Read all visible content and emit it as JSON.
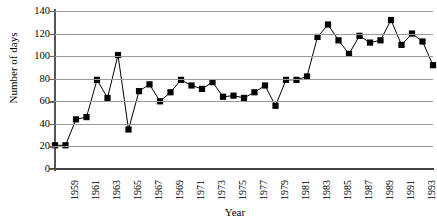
{
  "chart_data": {
    "type": "line",
    "title": "",
    "xlabel": "Year",
    "ylabel": "Number of days",
    "ylim": [
      0,
      140
    ],
    "ytick_values": [
      0,
      20,
      40,
      60,
      80,
      100,
      120,
      140
    ],
    "ytick_labels": [
      "0",
      "20",
      "40",
      "60",
      "80",
      "100",
      "120",
      "140"
    ],
    "grid": "horizontal",
    "legend": "none",
    "marker": "filled-square",
    "xtick_labels": [
      "1959",
      "1961",
      "1963",
      "1965",
      "1967",
      "1969",
      "1971",
      "1973",
      "1975",
      "1977",
      "1979",
      "1981",
      "1983",
      "1985",
      "1987",
      "1989",
      "1991",
      "1993"
    ],
    "x": [
      1958,
      1959,
      1960,
      1961,
      1962,
      1963,
      1964,
      1965,
      1966,
      1967,
      1968,
      1969,
      1970,
      1971,
      1972,
      1973,
      1974,
      1975,
      1976,
      1977,
      1978,
      1979,
      1980,
      1981,
      1982,
      1983,
      1984,
      1985,
      1986,
      1987,
      1988,
      1989,
      1990,
      1991,
      1992,
      1993,
      1994
    ],
    "values": [
      21,
      21,
      44,
      46,
      79,
      63,
      101,
      35,
      69,
      75,
      60,
      68,
      79,
      74,
      71,
      77,
      64,
      65,
      63,
      68,
      74,
      56,
      79,
      79,
      82,
      117,
      128,
      114,
      102,
      118,
      112,
      114,
      132,
      110,
      120,
      113,
      92
    ],
    "series": [
      {
        "name": "Number of days",
        "values": [
          21,
          21,
          44,
          46,
          79,
          63,
          101,
          35,
          69,
          75,
          60,
          68,
          79,
          74,
          71,
          77,
          64,
          65,
          63,
          68,
          74,
          56,
          79,
          79,
          82,
          117,
          128,
          114,
          102,
          118,
          112,
          114,
          132,
          110,
          120,
          113,
          92
        ]
      }
    ],
    "line_color": "#000000",
    "marker_color": "#000000",
    "gridline_color": "#9a9a9a"
  }
}
